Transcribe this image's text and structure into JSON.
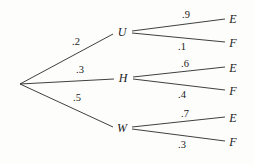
{
  "diagram": {
    "type": "probability-tree",
    "title": "",
    "root": {
      "label": "",
      "x": 20,
      "y": 84
    },
    "stage1": {
      "nodes": [
        {
          "label": "U",
          "x": 122,
          "y": 32,
          "probability": ".2",
          "prob_x": 76,
          "prob_y": 42
        },
        {
          "label": "H",
          "x": 123,
          "y": 78,
          "probability": ".3",
          "prob_x": 80,
          "prob_y": 70
        },
        {
          "label": "W",
          "x": 122,
          "y": 128,
          "probability": ".5",
          "prob_x": 77,
          "prob_y": 98
        }
      ]
    },
    "stage2": {
      "branches": [
        {
          "parent": "U",
          "label": "E",
          "x": 233,
          "y": 19,
          "probability": ".9",
          "prob_x": 186,
          "prob_y": 15
        },
        {
          "parent": "U",
          "label": "F",
          "x": 233,
          "y": 43,
          "probability": ".1",
          "prob_x": 182,
          "prob_y": 47
        },
        {
          "parent": "H",
          "label": "E",
          "x": 233,
          "y": 68,
          "probability": ".6",
          "prob_x": 185,
          "prob_y": 64
        },
        {
          "parent": "H",
          "label": "F",
          "x": 233,
          "y": 91,
          "probability": ".4",
          "prob_x": 182,
          "prob_y": 95
        },
        {
          "parent": "W",
          "label": "E",
          "x": 233,
          "y": 118,
          "probability": ".7",
          "prob_x": 185,
          "prob_y": 114
        },
        {
          "parent": "W",
          "label": "F",
          "x": 233,
          "y": 142,
          "probability": ".3",
          "prob_x": 182,
          "prob_y": 145
        }
      ]
    },
    "colors": {
      "line": "#2a2a2a",
      "text": "#1a1a1a",
      "background": "#fdfdfc"
    }
  }
}
